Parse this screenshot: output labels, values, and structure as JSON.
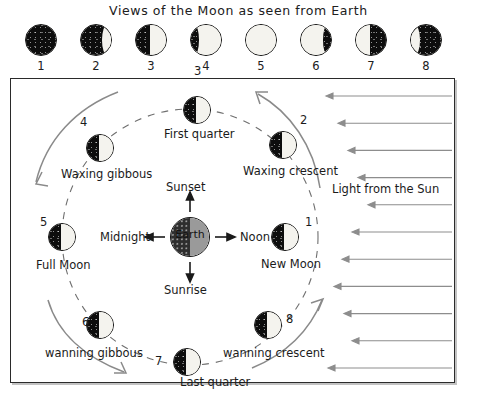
{
  "title": "Views of the Moon as seen from Earth",
  "phase_strip": {
    "phases": [
      {
        "num": "1",
        "name": "new",
        "lit_fraction": 0.0,
        "lit_side": "right"
      },
      {
        "num": "2",
        "name": "waxing-crescent",
        "lit_fraction": 0.12,
        "lit_side": "right"
      },
      {
        "num": "3",
        "name": "first-quarter",
        "lit_fraction": 0.5,
        "lit_side": "right"
      },
      {
        "num": "4",
        "name": "waxing-gibbous",
        "lit_fraction": 0.85,
        "lit_side": "right"
      },
      {
        "num": "5",
        "name": "full",
        "lit_fraction": 1.0,
        "lit_side": "right"
      },
      {
        "num": "6",
        "name": "waning-gibbous",
        "lit_fraction": 0.85,
        "lit_side": "left"
      },
      {
        "num": "7",
        "name": "last-quarter",
        "lit_fraction": 0.5,
        "lit_side": "left"
      },
      {
        "num": "8",
        "name": "waning-crescent",
        "lit_fraction": 0.12,
        "lit_side": "left"
      }
    ]
  },
  "diagram": {
    "earth_label": "Earth",
    "time_labels": {
      "top": "Sunset",
      "right": "Noon",
      "bottom": "Sunrise",
      "left": "Midnight"
    },
    "sun_label": "Light from the Sun",
    "sun_ray_count": 11,
    "orbit_moons": [
      {
        "num": "1",
        "label": "New Moon",
        "x": 285,
        "y": 237,
        "num_dx": 20,
        "num_dy": -2,
        "label_dx": -24,
        "label_dy": 20
      },
      {
        "num": "2",
        "label": "Waxing crescent",
        "x": 283,
        "y": 145,
        "num_dx": 17,
        "num_dy": -12,
        "label_dx": -40,
        "label_dy": 19
      },
      {
        "num": "3",
        "label": "First quarter",
        "x": 197,
        "y": 110,
        "num_dx": -3,
        "num_dy": -26,
        "label_dx": -33,
        "label_dy": 17
      },
      {
        "num": "4",
        "label": "Waxing gibbous",
        "x": 100,
        "y": 148,
        "num_dx": -20,
        "num_dy": -13,
        "label_dx": -39,
        "label_dy": 19
      },
      {
        "num": "5",
        "label": "Full Moon",
        "x": 62,
        "y": 237,
        "num_dx": -22,
        "num_dy": -2,
        "label_dx": -26,
        "label_dy": 21
      },
      {
        "num": "6",
        "label": "wanning gibbous",
        "x": 100,
        "y": 325,
        "num_dx": -18,
        "num_dy": 10,
        "label_dx": -55,
        "label_dy": 21
      },
      {
        "num": "7",
        "label": "Last quarter",
        "x": 187,
        "y": 362,
        "num_dx": -32,
        "num_dy": 12,
        "label_dx": -7,
        "label_dy": 13
      },
      {
        "num": "8",
        "label": "wanning crescent",
        "x": 268,
        "y": 325,
        "num_dx": 18,
        "num_dy": 7,
        "label_dx": -45,
        "label_dy": 21
      }
    ]
  },
  "colors": {
    "dark_side": "#0d0d0d",
    "lit_side": "#f4f3ee",
    "earth_day": "#9a9a9a",
    "earth_night": "#2e2e2e",
    "sun_ray": "#8d8d8d",
    "orbit_dash": "#6f6f6f",
    "border": "#2a2a2a"
  }
}
